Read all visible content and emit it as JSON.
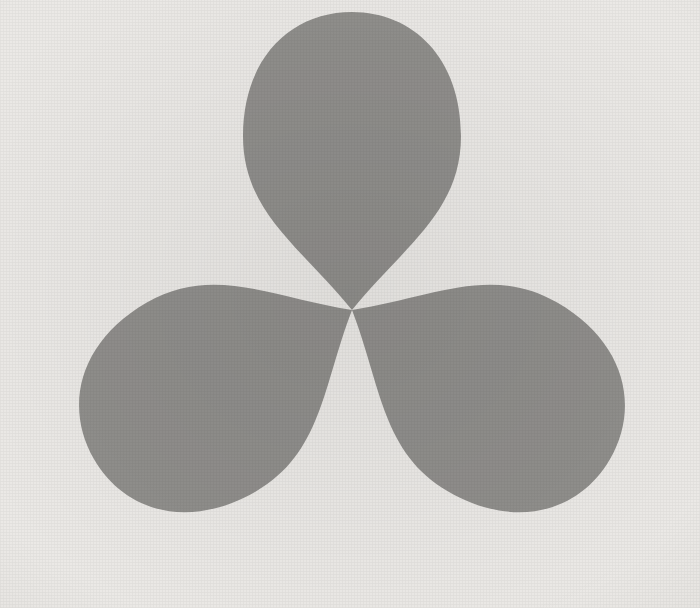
{
  "artwork": {
    "title": "Trefoil Overlap Composition",
    "medium_note": "three translucent ovoid lobes, 120-degree rotational symmetry",
    "canvas": {
      "width": 700,
      "height": 608
    },
    "background_color": "#ebe9e6",
    "lobe_color": "#5f5f5d",
    "lobe_opacity": "0.62",
    "observed_tones": {
      "background": "#ebe9e6",
      "one_layer": "#b0b0ae",
      "two_layers": "#3b3b3b",
      "three_layers": "#0a0a0a"
    },
    "center": {
      "x": 352,
      "y": 310
    },
    "symmetry_order": 3,
    "lobes": [
      {
        "name": "lobe-top",
        "rotation_deg": 0,
        "label": "upper lobe"
      },
      {
        "name": "lobe-lower-left",
        "rotation_deg": 120,
        "label": "lower-left lobe"
      },
      {
        "name": "lobe-lower-right",
        "rotation_deg": 240,
        "label": "lower-right lobe"
      }
    ],
    "lobe_path": "M 352 310 C 300 246 243 212 243 136 C 243 58 291 12 352 12 C 413 12 461 58 461 136 C 461 212 404 246 352 310 Z"
  }
}
